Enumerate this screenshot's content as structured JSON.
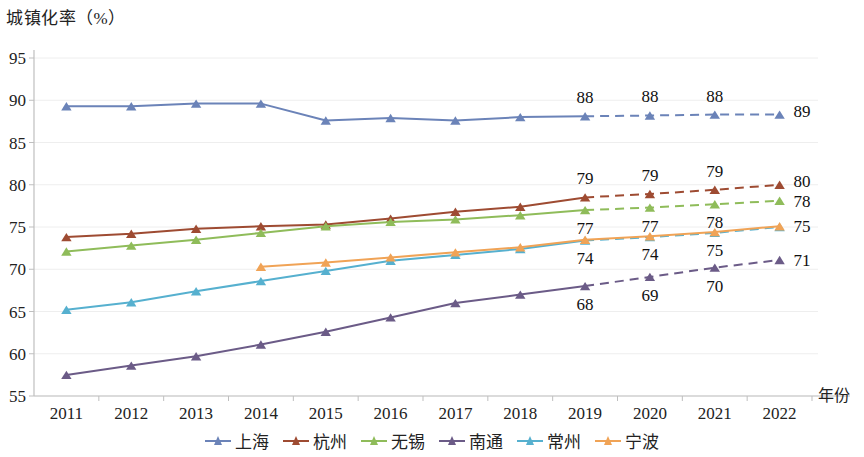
{
  "chart_data": {
    "type": "line",
    "title": "",
    "ylabel": "城镇化率（%）",
    "xlabel": "年份",
    "categories": [
      "2011",
      "2012",
      "2013",
      "2014",
      "2015",
      "2016",
      "2017",
      "2018",
      "2019",
      "2020",
      "2021",
      "2022"
    ],
    "ylim": [
      55,
      95
    ],
    "ytick_step": 5,
    "yticks": [
      "95",
      "90",
      "85",
      "80",
      "75",
      "70",
      "65",
      "60",
      "55"
    ],
    "grid": true,
    "legend_position": "bottom-center",
    "solid_until": "2019",
    "dashed_from": "2019",
    "series": [
      {
        "name": "上海",
        "color": "#6b83b8",
        "values": [
          89.3,
          89.3,
          89.6,
          89.6,
          87.6,
          87.9,
          87.6,
          88.0,
          88.1,
          88.2,
          88.3,
          88.3
        ],
        "labels": [
          null,
          null,
          null,
          null,
          null,
          null,
          null,
          null,
          "88",
          "88",
          "88",
          "89"
        ],
        "label_position": "above"
      },
      {
        "name": "杭州",
        "color": "#9e4b32",
        "values": [
          73.8,
          74.2,
          74.8,
          75.1,
          75.3,
          76.0,
          76.8,
          77.4,
          78.5,
          78.9,
          79.4,
          80.0
        ],
        "labels": [
          null,
          null,
          null,
          null,
          null,
          null,
          null,
          null,
          "79",
          "79",
          "79",
          "80"
        ],
        "label_position": "above"
      },
      {
        "name": "无锡",
        "color": "#8fbc5a",
        "values": [
          72.1,
          72.8,
          73.5,
          74.3,
          75.1,
          75.6,
          75.9,
          76.4,
          77.0,
          77.3,
          77.7,
          78.1
        ],
        "labels": [
          null,
          null,
          null,
          null,
          null,
          null,
          null,
          null,
          "77",
          "77",
          "78",
          "78"
        ],
        "label_position": "below"
      },
      {
        "name": "南通",
        "color": "#6b5b87",
        "values": [
          57.5,
          58.6,
          59.7,
          61.1,
          62.6,
          64.3,
          66.0,
          67.0,
          68.0,
          69.1,
          70.2,
          71.1
        ],
        "labels": [
          null,
          null,
          null,
          null,
          null,
          null,
          null,
          null,
          "68",
          "69",
          "70",
          "71"
        ],
        "label_position": "below"
      },
      {
        "name": "常州",
        "color": "#56b0cf",
        "values": [
          65.2,
          66.1,
          67.4,
          68.6,
          69.8,
          71.0,
          71.7,
          72.4,
          73.4,
          73.8,
          74.3,
          75.0
        ],
        "labels": [
          null,
          null,
          null,
          null,
          null,
          null,
          null,
          null,
          null,
          null,
          null,
          null
        ],
        "label_position": "below"
      },
      {
        "name": "宁波",
        "color": "#f0a356",
        "values": [
          null,
          null,
          null,
          70.3,
          70.8,
          71.4,
          72.0,
          72.6,
          73.5,
          73.9,
          74.4,
          75.1
        ],
        "labels": [
          null,
          null,
          null,
          null,
          null,
          null,
          null,
          null,
          "74",
          "74",
          "75",
          "75"
        ],
        "label_position": "below",
        "solid_all": true
      }
    ]
  },
  "axes": {
    "y_title": "城镇化率（%）",
    "x_title": "年份"
  },
  "legend": {
    "items": [
      {
        "label": "上海",
        "color": "#6b83b8"
      },
      {
        "label": "杭州",
        "color": "#9e4b32"
      },
      {
        "label": "无锡",
        "color": "#8fbc5a"
      },
      {
        "label": "南通",
        "color": "#6b5b87"
      },
      {
        "label": "常州",
        "color": "#56b0cf"
      },
      {
        "label": "宁波",
        "color": "#f0a356"
      }
    ]
  },
  "style": {
    "grid_color": "#eeeeee",
    "axis_color": "#bfbfbf",
    "background": "#ffffff"
  }
}
